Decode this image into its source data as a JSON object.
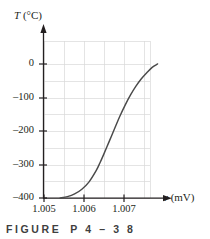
{
  "figure": {
    "caption_label": "FIGURE",
    "caption_number": "P 4 – 3 8",
    "caption_full": "FIGURE P4-38"
  },
  "axes": {
    "y_label_symbol": "T",
    "y_label_units": "(°C)",
    "y_label_full": "T (°C)",
    "x_label_symbol": "v",
    "x_label_units": "(mV)",
    "x_label_full": "v (mV)",
    "y_ticks": [
      "0",
      "–100",
      "–200",
      "–300",
      "–400"
    ],
    "x_ticks": [
      "1.005",
      "1.006",
      "1.007"
    ]
  },
  "colors": {
    "curve": "#4a4a4a",
    "axis": "#231f20",
    "grid": "#d9d9d9",
    "text": "#231f20",
    "caption": "#3f3f3f",
    "background": "#ffffff"
  },
  "chart_data": {
    "type": "line",
    "title": "",
    "subtitle": "",
    "xlabel": "v (mV)",
    "ylabel": "T (°C)",
    "xlim": [
      1.00455,
      1.00785
    ],
    "ylim": [
      -430,
      55
    ],
    "x_tick_values": [
      1.005,
      1.006,
      1.007
    ],
    "y_tick_values": [
      0,
      -100,
      -200,
      -300,
      -400
    ],
    "grid": true,
    "grid_x_step": 0.0005,
    "grid_y_step": 50,
    "legend": null,
    "annotations": [],
    "series": [
      {
        "name": "Thermocouple output vs. temperature",
        "x": [
          1.005,
          1.0052,
          1.0054,
          1.0056,
          1.0058,
          1.006,
          1.0061,
          1.0062,
          1.00635,
          1.0065,
          1.00665,
          1.0068,
          1.00695,
          1.0071,
          1.00725,
          1.0074,
          1.00755,
          1.0077
        ],
        "y": [
          -400,
          -396,
          -388,
          -374,
          -352,
          -318,
          -296,
          -272,
          -234,
          -196,
          -158,
          -124,
          -94,
          -68,
          -46,
          -28,
          -12,
          -2
        ]
      }
    ]
  }
}
